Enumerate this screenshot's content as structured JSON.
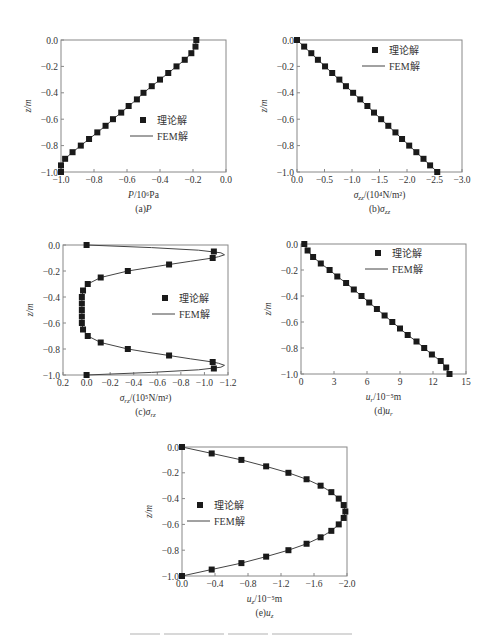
{
  "legend": {
    "marker_label": "理论解",
    "line_label": "FEM解"
  },
  "colors": {
    "axis": "#888888",
    "marker": "#1a1a1a",
    "line": "#444444",
    "text": "#333333"
  },
  "chart_data": [
    {
      "id": "a",
      "type": "line",
      "title": "(a)P",
      "caption": "(a)P",
      "xlabel": "P/10⁶Pa",
      "ylabel": "z/m",
      "xlim": [
        -1.0,
        0.0
      ],
      "ylim": [
        -1.0,
        0.0
      ],
      "xticks": [
        -1.0,
        -0.8,
        -0.6,
        -0.4,
        -0.2,
        0.0
      ],
      "xtick_labels": [
        "−1.0",
        "−0.8",
        "−0.6",
        "−0.4",
        "−0.2",
        "0.0"
      ],
      "yticks": [
        0.0,
        -0.2,
        -0.4,
        -0.6,
        -0.8,
        -1.0
      ],
      "ytick_labels": [
        "0.0",
        "−0.2",
        "−0.4",
        "−0.6",
        "−0.8",
        "−1.0"
      ],
      "grid": false,
      "legend_position": "center-right",
      "series": [
        {
          "name": "理论解",
          "style": "marker",
          "z": [
            0,
            -0.05,
            -0.1,
            -0.15,
            -0.2,
            -0.25,
            -0.3,
            -0.35,
            -0.4,
            -0.45,
            -0.5,
            -0.55,
            -0.6,
            -0.65,
            -0.7,
            -0.75,
            -0.8,
            -0.85,
            -0.9,
            -0.95,
            -1.0
          ],
          "x": [
            -0.18,
            -0.185,
            -0.21,
            -0.25,
            -0.3,
            -0.35,
            -0.4,
            -0.45,
            -0.5,
            -0.54,
            -0.59,
            -0.635,
            -0.685,
            -0.73,
            -0.78,
            -0.83,
            -0.88,
            -0.93,
            -0.975,
            -1.0,
            -1.0
          ]
        },
        {
          "name": "FEM解",
          "style": "line",
          "z": [
            0,
            -0.05,
            -0.1,
            -0.15,
            -0.2,
            -0.25,
            -0.3,
            -0.35,
            -0.4,
            -0.45,
            -0.5,
            -0.55,
            -0.6,
            -0.65,
            -0.7,
            -0.75,
            -0.8,
            -0.85,
            -0.9,
            -0.95,
            -1.0
          ],
          "x": [
            -0.18,
            -0.185,
            -0.21,
            -0.25,
            -0.3,
            -0.35,
            -0.4,
            -0.45,
            -0.5,
            -0.54,
            -0.59,
            -0.635,
            -0.685,
            -0.73,
            -0.78,
            -0.83,
            -0.88,
            -0.93,
            -0.975,
            -1.0,
            -1.0
          ]
        }
      ]
    },
    {
      "id": "b",
      "type": "line",
      "title": "(b)σzz",
      "caption": "(b)σ",
      "caption_sub": "zz",
      "xlabel": "σ",
      "xlabel_sub": "zz",
      "xlabel_rest": "/(10⁴N/m²)",
      "ylabel": "z/m",
      "xlim": [
        0.0,
        -3.0
      ],
      "ylim": [
        -1.0,
        0.0
      ],
      "xticks": [
        0.0,
        -0.5,
        -1.0,
        -1.5,
        -2.0,
        -2.5,
        -3.0
      ],
      "xtick_labels": [
        "0.0",
        "−0.5",
        "−1.0",
        "−1.5",
        "−2.0",
        "−2.5",
        "−3.0"
      ],
      "yticks": [
        0.0,
        -0.2,
        -0.4,
        -0.6,
        -0.8,
        -1.0
      ],
      "ytick_labels": [
        "0.0",
        "−0.2",
        "−0.4",
        "−0.6",
        "−0.8",
        "−1.0"
      ],
      "grid": false,
      "legend_position": "upper-right",
      "series": [
        {
          "name": "理论解",
          "style": "marker",
          "z": [
            0,
            -0.05,
            -0.1,
            -0.15,
            -0.2,
            -0.25,
            -0.3,
            -0.35,
            -0.4,
            -0.45,
            -0.5,
            -0.55,
            -0.6,
            -0.65,
            -0.7,
            -0.75,
            -0.8,
            -0.85,
            -0.9,
            -0.95,
            -1.0
          ],
          "x": [
            0,
            -0.13,
            -0.26,
            -0.38,
            -0.51,
            -0.64,
            -0.77,
            -0.89,
            -1.02,
            -1.15,
            -1.28,
            -1.4,
            -1.53,
            -1.66,
            -1.79,
            -1.91,
            -2.04,
            -2.17,
            -2.3,
            -2.42,
            -2.55
          ]
        },
        {
          "name": "FEM解",
          "style": "line",
          "z": [
            0,
            -1.0
          ],
          "x": [
            0,
            -2.55
          ]
        }
      ]
    },
    {
      "id": "c",
      "type": "line",
      "title": "(c)σrz",
      "caption": "(c)σ",
      "caption_sub": "rz",
      "xlabel": "σ",
      "xlabel_sub": "rz",
      "xlabel_rest": "/(10⁵N/m²)",
      "ylabel": "z/m",
      "xlim": [
        0.2,
        -1.2
      ],
      "ylim": [
        -1.0,
        0.0
      ],
      "xticks": [
        0.2,
        0.0,
        -0.2,
        -0.4,
        -0.6,
        -0.8,
        -1.0,
        -1.2
      ],
      "xtick_labels": [
        "0.2",
        "0.0",
        "−0.2",
        "−0.4",
        "−0.6",
        "−0.8",
        "−1.0",
        "−1.2"
      ],
      "yticks": [
        0.0,
        -0.2,
        -0.4,
        -0.6,
        -0.8,
        -1.0
      ],
      "ytick_labels": [
        "0.0",
        "−0.2",
        "−0.4",
        "−0.6",
        "−0.8",
        "−1.0"
      ],
      "grid": false,
      "legend_position": "center-right",
      "series": [
        {
          "name": "理论解",
          "style": "marker",
          "z": [
            0,
            -0.05,
            -0.1,
            -0.15,
            -0.2,
            -0.25,
            -0.3,
            -0.35,
            -0.4,
            -0.45,
            -0.5,
            -0.55,
            -0.6,
            -0.65,
            -0.7,
            -0.75,
            -0.8,
            -0.85,
            -0.9,
            -0.95,
            -1.0
          ],
          "x": [
            0,
            -1.08,
            -1.07,
            -0.7,
            -0.35,
            -0.12,
            -0.01,
            0.03,
            0.04,
            0.04,
            0.04,
            0.04,
            0.04,
            0.03,
            -0.01,
            -0.12,
            -0.35,
            -0.7,
            -1.07,
            -1.08,
            0
          ]
        },
        {
          "name": "FEM解",
          "style": "line",
          "z": [
            0,
            -0.02,
            -0.04,
            -0.06,
            -0.075,
            -0.09,
            -0.1,
            -0.125,
            -0.15,
            -0.175,
            -0.2,
            -0.25,
            -0.3,
            -0.35,
            -0.4,
            -0.5,
            -0.6,
            -0.65,
            -0.7,
            -0.75,
            -0.8,
            -0.825,
            -0.85,
            -0.875,
            -0.9,
            -0.91,
            -0.925,
            -0.94,
            -0.96,
            -0.98,
            -1.0
          ],
          "x": [
            0,
            -0.55,
            -0.95,
            -1.14,
            -1.17,
            -1.12,
            -1.07,
            -0.88,
            -0.7,
            -0.52,
            -0.35,
            -0.12,
            -0.01,
            0.03,
            0.04,
            0.04,
            0.04,
            0.03,
            -0.01,
            -0.12,
            -0.35,
            -0.52,
            -0.7,
            -0.88,
            -1.07,
            -1.12,
            -1.17,
            -1.14,
            -0.95,
            -0.55,
            0
          ]
        }
      ]
    },
    {
      "id": "d",
      "type": "line",
      "title": "(d)ur",
      "caption": "(d)u",
      "caption_sub": "r",
      "xlabel": "u",
      "xlabel_sub": "r",
      "xlabel_rest": "/10⁻⁵m",
      "ylabel": "z/m",
      "xlim": [
        0,
        15
      ],
      "ylim": [
        -1.0,
        0.0
      ],
      "xticks": [
        0,
        3,
        6,
        9,
        12,
        15
      ],
      "xtick_labels": [
        "0",
        "3",
        "6",
        "9",
        "12",
        "15"
      ],
      "yticks": [
        0.0,
        -0.2,
        -0.4,
        -0.6,
        -0.8,
        -1.0
      ],
      "ytick_labels": [
        "0.0",
        "−0.2",
        "−0.4",
        "−0.6",
        "−0.8",
        "−1.0"
      ],
      "grid": false,
      "legend_position": "upper-right",
      "series": [
        {
          "name": "理论解",
          "style": "marker",
          "z": [
            0,
            -0.05,
            -0.1,
            -0.15,
            -0.2,
            -0.25,
            -0.3,
            -0.35,
            -0.4,
            -0.45,
            -0.5,
            -0.55,
            -0.6,
            -0.65,
            -0.7,
            -0.75,
            -0.8,
            -0.85,
            -0.9,
            -0.95,
            -1.0
          ],
          "x": [
            0.3,
            0.6,
            1.1,
            1.8,
            2.6,
            3.3,
            4.1,
            4.8,
            5.5,
            6.2,
            6.9,
            7.6,
            8.3,
            9.0,
            9.7,
            10.5,
            11.2,
            11.9,
            12.7,
            13.2,
            13.5
          ]
        },
        {
          "name": "FEM解",
          "style": "line",
          "z": [
            0,
            -0.05,
            -0.1,
            -0.15,
            -0.2,
            -0.25,
            -0.3,
            -0.35,
            -0.4,
            -0.45,
            -0.5,
            -0.55,
            -0.6,
            -0.65,
            -0.7,
            -0.75,
            -0.8,
            -0.85,
            -0.9,
            -0.95,
            -1.0
          ],
          "x": [
            0.3,
            0.6,
            1.1,
            1.8,
            2.6,
            3.3,
            4.1,
            4.8,
            5.5,
            6.2,
            6.9,
            7.6,
            8.3,
            9.0,
            9.7,
            10.5,
            11.2,
            11.9,
            12.7,
            13.2,
            13.5
          ]
        }
      ]
    },
    {
      "id": "e",
      "type": "line",
      "title": "(e)uz",
      "caption": "(e)u",
      "caption_sub": "z",
      "xlabel": "u",
      "xlabel_sub": "z",
      "xlabel_rest": "/10⁻⁵m",
      "ylabel": "z/m",
      "xlim": [
        0.0,
        -2.0
      ],
      "ylim": [
        -1.0,
        0.0
      ],
      "xticks": [
        0.0,
        -0.4,
        -0.8,
        -1.2,
        -1.6,
        -2.0
      ],
      "xtick_labels": [
        "0.0",
        "−0.4",
        "−0.8",
        "−1.2",
        "−1.6",
        "−2.0"
      ],
      "yticks": [
        0.0,
        -0.2,
        -0.4,
        -0.6,
        -0.8,
        -1.0
      ],
      "ytick_labels": [
        "0.0",
        "−0.2",
        "−0.4",
        "−0.6",
        "−0.8",
        "−1.0"
      ],
      "grid": false,
      "legend_position": "center-left",
      "series": [
        {
          "name": "理论解",
          "style": "marker",
          "z": [
            0,
            -0.05,
            -0.1,
            -0.15,
            -0.2,
            -0.25,
            -0.3,
            -0.35,
            -0.4,
            -0.45,
            -0.5,
            -0.55,
            -0.6,
            -0.65,
            -0.7,
            -0.75,
            -0.8,
            -0.85,
            -0.9,
            -0.95,
            -1.0
          ],
          "x": [
            0,
            -0.36,
            -0.72,
            -1.02,
            -1.29,
            -1.51,
            -1.68,
            -1.81,
            -1.9,
            -1.96,
            -1.98,
            -1.96,
            -1.9,
            -1.81,
            -1.68,
            -1.51,
            -1.29,
            -1.02,
            -0.72,
            -0.36,
            0
          ]
        },
        {
          "name": "FEM解",
          "style": "line",
          "z": [
            0,
            -0.05,
            -0.1,
            -0.15,
            -0.2,
            -0.25,
            -0.3,
            -0.35,
            -0.4,
            -0.45,
            -0.5,
            -0.55,
            -0.6,
            -0.65,
            -0.7,
            -0.75,
            -0.8,
            -0.85,
            -0.9,
            -0.95,
            -1.0
          ],
          "x": [
            0,
            -0.36,
            -0.72,
            -1.02,
            -1.29,
            -1.51,
            -1.68,
            -1.81,
            -1.9,
            -1.96,
            -1.98,
            -1.96,
            -1.9,
            -1.81,
            -1.68,
            -1.51,
            -1.29,
            -1.02,
            -0.72,
            -0.36,
            0
          ]
        }
      ]
    }
  ],
  "layout": {
    "panels": [
      {
        "id": "a",
        "box": [
          61,
          40,
          165,
          132
        ],
        "legend": [
          143,
          120
        ]
      },
      {
        "id": "b",
        "box": [
          297,
          40,
          165,
          132
        ],
        "legend": [
          375,
          50
        ]
      },
      {
        "id": "c",
        "box": [
          63,
          245,
          165,
          130
        ],
        "legend": [
          165,
          298
        ]
      },
      {
        "id": "d",
        "box": [
          301,
          244,
          165,
          130
        ],
        "legend": [
          378,
          253
        ]
      },
      {
        "id": "e",
        "box": [
          182,
          447,
          165,
          129
        ],
        "legend": [
          200,
          505
        ]
      }
    ]
  }
}
